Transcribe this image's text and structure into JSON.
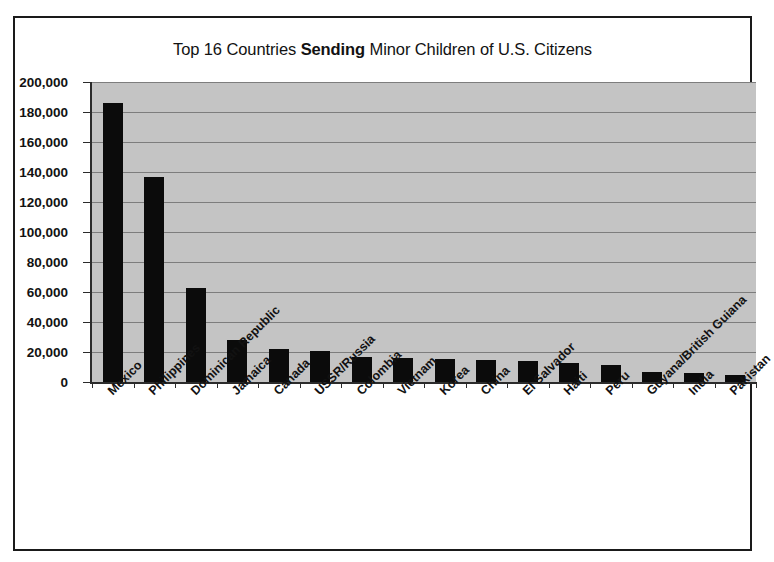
{
  "chart_data": {
    "type": "bar",
    "title": "Top 16 Countries Sending Minor Children of U.S. Citizens",
    "title_parts": {
      "before": "Top 16 Countries ",
      "emphasis": "Sending",
      "after": " Minor Children of U.S. Citizens"
    },
    "xlabel": "",
    "ylabel": "",
    "ylim": [
      0,
      200000
    ],
    "grid": true,
    "legend": false,
    "yticks": [
      0,
      20000,
      40000,
      60000,
      80000,
      100000,
      120000,
      140000,
      160000,
      180000,
      200000
    ],
    "ytick_labels": [
      "0",
      "20,000",
      "40,000",
      "60,000",
      "80,000",
      "100,000",
      "120,000",
      "140,000",
      "160,000",
      "180,000",
      "200,000"
    ],
    "categories": [
      "Mexico",
      "Philippines",
      "Dominican Republic",
      "Jamaica",
      "Canada",
      "USSR/Russia",
      "Colombia",
      "Vietnam",
      "Korea",
      "China",
      "El Salvador",
      "Haiti",
      "Peru",
      "Guyana/British Guiana",
      "India",
      "Pakistan"
    ],
    "values": [
      186000,
      137000,
      63000,
      28000,
      22000,
      21000,
      17000,
      16000,
      15500,
      14500,
      14000,
      12500,
      11500,
      7000,
      6000,
      5000
    ],
    "colors": {
      "bar": "#0b0b0b",
      "plot_background": "#c4c4c4",
      "gridline": "#7d7d7d",
      "axis": "#2b2b2b",
      "text": "#121212",
      "frame": "#1a1a1a",
      "page_background": "#ffffff"
    }
  }
}
